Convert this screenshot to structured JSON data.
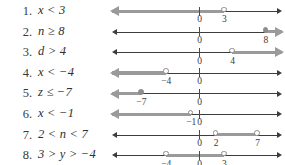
{
  "page": {
    "background_color": "#ffffff",
    "text_color": "#2e2e2e",
    "highlight_color": "#9a9a9a",
    "axis_color": "#3d3d3d"
  },
  "axis": {
    "zero_x_px": 199,
    "unit_px": 8.3,
    "left_end_px": 114,
    "right_end_px": 280
  },
  "problems": [
    {
      "number": "1.",
      "expression": "x < 3",
      "variable": "x",
      "relation": "less-than",
      "boundaries": [
        {
          "value": 3,
          "label": "3",
          "marker": "open"
        }
      ],
      "zero_label": "0",
      "shading": "ray-left",
      "left_arrow": "highlighted",
      "right_arrow": "plain"
    },
    {
      "number": "2.",
      "expression": "n ≥ 8",
      "variable": "n",
      "relation": "greater-or-equal",
      "boundaries": [
        {
          "value": 8,
          "label": "8",
          "marker": "closed"
        }
      ],
      "zero_label": "0",
      "shading": "ray-right",
      "left_arrow": "plain",
      "right_arrow": "highlighted"
    },
    {
      "number": "3.",
      "expression": "d > 4",
      "variable": "d",
      "relation": "greater-than",
      "boundaries": [
        {
          "value": 4,
          "label": "4",
          "marker": "open"
        }
      ],
      "zero_label": "0",
      "shading": "ray-right",
      "left_arrow": "plain",
      "right_arrow": "highlighted"
    },
    {
      "number": "4.",
      "expression": "x < −4",
      "variable": "x",
      "relation": "less-than",
      "boundaries": [
        {
          "value": -4,
          "label": "−4",
          "marker": "open"
        }
      ],
      "zero_label": "0",
      "shading": "ray-left",
      "left_arrow": "highlighted",
      "right_arrow": "plain"
    },
    {
      "number": "5.",
      "expression": "z ≤ −7",
      "variable": "z",
      "relation": "less-or-equal",
      "boundaries": [
        {
          "value": -7,
          "label": "−7",
          "marker": "closed"
        }
      ],
      "zero_label": "0",
      "shading": "ray-left",
      "left_arrow": "highlighted",
      "right_arrow": "plain"
    },
    {
      "number": "6.",
      "expression": "x < −1",
      "variable": "x",
      "relation": "less-than",
      "boundaries": [
        {
          "value": -1,
          "label": "−1",
          "marker": "open"
        }
      ],
      "zero_label": "0",
      "shading": "ray-left",
      "left_arrow": "highlighted",
      "right_arrow": "plain"
    },
    {
      "number": "7.",
      "expression": "2 < n < 7",
      "variable": "n",
      "relation": "between-exclusive",
      "boundaries": [
        {
          "value": 2,
          "label": "2",
          "marker": "open"
        },
        {
          "value": 7,
          "label": "7",
          "marker": "open"
        }
      ],
      "zero_label": "0",
      "shading": "segment",
      "left_arrow": "plain",
      "right_arrow": "plain"
    },
    {
      "number": "8.",
      "expression": "3 > y > −4",
      "variable": "y",
      "relation": "between-exclusive",
      "boundaries": [
        {
          "value": -4,
          "label": "−4",
          "marker": "open"
        },
        {
          "value": 3,
          "label": "3",
          "marker": "open"
        }
      ],
      "zero_label": "0",
      "shading": "segment",
      "left_arrow": "plain",
      "right_arrow": "plain"
    }
  ]
}
